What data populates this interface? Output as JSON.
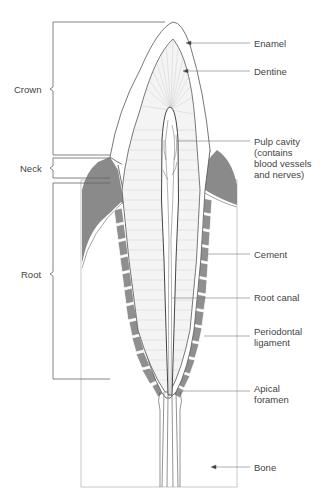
{
  "regions": [
    {
      "label": "Crown",
      "top": 22,
      "bottom": 155,
      "label_y": 89
    },
    {
      "label": "Neck",
      "top": 158,
      "bottom": 180,
      "label_y": 168
    },
    {
      "label": "Root",
      "top": 183,
      "bottom": 380,
      "label_y": 274
    }
  ],
  "labels": [
    {
      "id": "enamel",
      "text": "Enamel",
      "y": 38
    },
    {
      "id": "dentine",
      "text": "Dentine",
      "y": 66
    },
    {
      "id": "pulp",
      "text": "Pulp cavity\n(contains\nblood vessels\nand nerves)",
      "y": 136
    },
    {
      "id": "cement",
      "text": "Cement",
      "y": 249
    },
    {
      "id": "root-canal",
      "text": "Root canal",
      "y": 292
    },
    {
      "id": "periodontal",
      "text": "Periodontal\nligament",
      "y": 326
    },
    {
      "id": "apical",
      "text": "Apical\nforamen",
      "y": 383
    },
    {
      "id": "bone",
      "text": "Bone",
      "y": 462
    }
  ],
  "colors": {
    "gum": "#8a8a8a",
    "ligament": "#8f8f8f",
    "line": "#555555",
    "dentine_hatch": "#c8c8c8",
    "text": "#444444"
  }
}
